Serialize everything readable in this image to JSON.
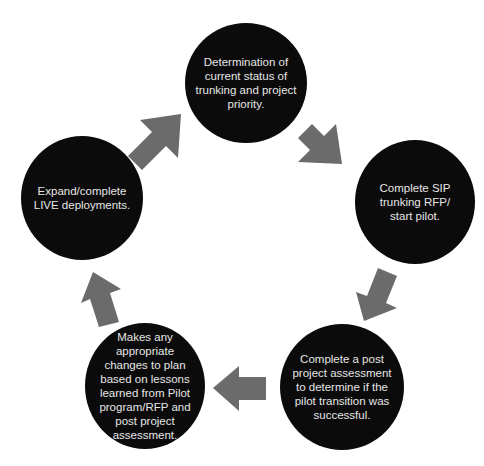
{
  "diagram": {
    "type": "cycle",
    "colors": {
      "node_fill": "#0b0b0b",
      "node_text": "#e6e6e6",
      "arrow_fill": "#6b6b6b",
      "background": "#ffffff"
    },
    "nodes": [
      {
        "id": "step-1",
        "label": "Determination of\ncurrent status of\ntrunking and project\npriority."
      },
      {
        "id": "step-2",
        "label": "Complete SIP\ntrunking RFP/\nstart pilot."
      },
      {
        "id": "step-3",
        "label": "Complete a post\nproject assessment\nto determine if the\npilot transition was\nsuccessful."
      },
      {
        "id": "step-4",
        "label": "Makes any\nappropriate\nchanges to plan\nbased on lessons\nlearned from Pilot\nprogram/RFP and\npost project\nassessment."
      },
      {
        "id": "step-5",
        "label": "Expand/complete\nLIVE deployments."
      }
    ],
    "arrows": [
      {
        "from": "step-5",
        "to": "step-1",
        "direction": "up-right"
      },
      {
        "from": "step-1",
        "to": "step-2",
        "direction": "down-right"
      },
      {
        "from": "step-2",
        "to": "step-3",
        "direction": "down-left"
      },
      {
        "from": "step-3",
        "to": "step-4",
        "direction": "left"
      },
      {
        "from": "step-4",
        "to": "step-5",
        "direction": "up"
      }
    ]
  }
}
